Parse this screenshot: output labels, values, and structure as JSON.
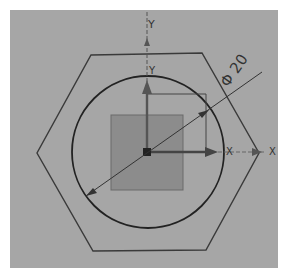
{
  "view": {
    "background_color": "#a6a6a6",
    "page_color": "#ffffff"
  },
  "sketch": {
    "hexagon_color": "#3a3a3a",
    "circle_color": "#222222",
    "square_fill": "#8c8c8c",
    "square_stroke": "#6a6a6a"
  },
  "dimension": {
    "symbol": "Φ",
    "value": "20",
    "label": "Φ 20"
  },
  "axes": {
    "wcs_y_label": "Y",
    "wcs_x_label": "X",
    "csys_y_label": "Y",
    "csys_x_label": "X"
  },
  "icons": {
    "origin": "origin-marker-icon",
    "x_arrow": "x-axis-arrow-icon",
    "y_arrow": "y-axis-arrow-icon"
  }
}
